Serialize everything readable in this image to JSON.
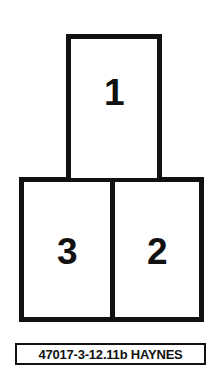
{
  "figure": {
    "background_color": "#ffffff",
    "line_color": "#111111"
  },
  "diagram": {
    "type": "numbered-box-sequence",
    "boxes": [
      {
        "id": "box-1",
        "label": "1",
        "position": "top-center"
      },
      {
        "id": "box-3",
        "label": "3",
        "position": "bottom-left"
      },
      {
        "id": "box-2",
        "label": "2",
        "position": "bottom-right"
      }
    ]
  },
  "caption": {
    "text": "47017-3-12.11b HAYNES",
    "reference_number": "47017-3-12.11b",
    "publisher": "HAYNES"
  }
}
